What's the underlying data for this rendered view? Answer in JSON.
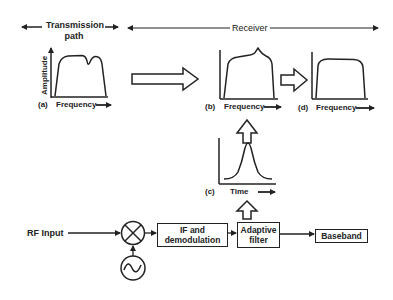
{
  "header": {
    "transmission_path": "Transmission\npath",
    "transmission_line1": "Transmission",
    "transmission_line2": "path",
    "receiver": "Receiver"
  },
  "plots": {
    "a": {
      "label": "(a)",
      "xlabel": "Frequency",
      "ylabel": "Amplitude",
      "shape": "flat passband with notch"
    },
    "b": {
      "label": "(b)",
      "xlabel": "Frequency",
      "shape": "passband with peak"
    },
    "c": {
      "label": "(c)",
      "xlabel": "Time",
      "shape": "gaussian pulse"
    },
    "d": {
      "label": "(d)",
      "xlabel": "Frequency",
      "shape": "equalized flat passband"
    }
  },
  "blocks": {
    "rf_input": "RF Input",
    "mixer": "mixer",
    "oscillator": "local oscillator",
    "if_demod_line1": "IF and",
    "if_demod_line2": "demodulation",
    "adaptive_line1": "Adaptive",
    "adaptive_line2": "filter",
    "baseband": "Baseband"
  },
  "colors": {
    "stroke": "#222222",
    "background": "#ffffff"
  }
}
